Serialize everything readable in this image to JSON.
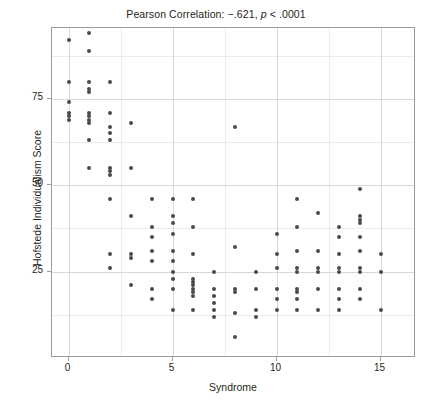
{
  "chart_data": {
    "type": "scatter",
    "title": "Pearson Correlation: −.621, p < .0001",
    "title_prefix": "Pearson Correlation: −.621, ",
    "title_italic": "p",
    "title_suffix": " < .0001",
    "xlabel": "Syndrome",
    "ylabel": "Hofstede Individualism Score",
    "xlim": [
      -0.8,
      16.7
    ],
    "ylim": [
      0,
      95.5
    ],
    "xticks": [
      0,
      5,
      10,
      15
    ],
    "xticklabels": [
      "0",
      "5",
      "10",
      "15"
    ],
    "yticks": [
      25,
      50,
      75
    ],
    "yticklabels": [
      "25",
      "50",
      "75"
    ],
    "grid": true,
    "grid_x_major": [
      0,
      5,
      10,
      15
    ],
    "grid_x_minor": [
      2.5,
      7.5,
      12.5
    ],
    "grid_y_major": [
      25,
      50,
      75
    ],
    "grid_y_minor": [
      12.5,
      37.5,
      62.5,
      87.5
    ],
    "marker_color": "#4a4a4a",
    "marker_size": 4,
    "frame_color": "#9b9b9b",
    "correlation": -0.621,
    "p_value": "< .0001",
    "n_points": 123,
    "points": [
      [
        0,
        92
      ],
      [
        0,
        80
      ],
      [
        0,
        74
      ],
      [
        0,
        71
      ],
      [
        0,
        70
      ],
      [
        0,
        69
      ],
      [
        1,
        94
      ],
      [
        1,
        89
      ],
      [
        1,
        80
      ],
      [
        1,
        78
      ],
      [
        1,
        77
      ],
      [
        1,
        71
      ],
      [
        1,
        70
      ],
      [
        1,
        69
      ],
      [
        1,
        68
      ],
      [
        1,
        63
      ],
      [
        1,
        55
      ],
      [
        2,
        80
      ],
      [
        2,
        71
      ],
      [
        2,
        67
      ],
      [
        2,
        65
      ],
      [
        2,
        63
      ],
      [
        2,
        55
      ],
      [
        2,
        54
      ],
      [
        2,
        53
      ],
      [
        2,
        46
      ],
      [
        2,
        30
      ],
      [
        2,
        26
      ],
      [
        3,
        68
      ],
      [
        3,
        55
      ],
      [
        3,
        41
      ],
      [
        3,
        30
      ],
      [
        3,
        29
      ],
      [
        3,
        21
      ],
      [
        4,
        46
      ],
      [
        4,
        38
      ],
      [
        4,
        35
      ],
      [
        4,
        31
      ],
      [
        4,
        28
      ],
      [
        4,
        20
      ],
      [
        4,
        17
      ],
      [
        5,
        46
      ],
      [
        5,
        41
      ],
      [
        5,
        39
      ],
      [
        5,
        36
      ],
      [
        5,
        31
      ],
      [
        5,
        28
      ],
      [
        5,
        25
      ],
      [
        5,
        23
      ],
      [
        5,
        20
      ],
      [
        5,
        14
      ],
      [
        6,
        46
      ],
      [
        6,
        38
      ],
      [
        6,
        30
      ],
      [
        6,
        23
      ],
      [
        6,
        22
      ],
      [
        6,
        21
      ],
      [
        6,
        20
      ],
      [
        6,
        19
      ],
      [
        6,
        18
      ],
      [
        6,
        14
      ],
      [
        7,
        25
      ],
      [
        7,
        20
      ],
      [
        7,
        18
      ],
      [
        7,
        16
      ],
      [
        7,
        14
      ],
      [
        7,
        12
      ],
      [
        8,
        67
      ],
      [
        8,
        32
      ],
      [
        8,
        20
      ],
      [
        8,
        19
      ],
      [
        8,
        13
      ],
      [
        8,
        6
      ],
      [
        9,
        25
      ],
      [
        9,
        20
      ],
      [
        9,
        14
      ],
      [
        9,
        12
      ],
      [
        10,
        36
      ],
      [
        10,
        30
      ],
      [
        10,
        26
      ],
      [
        10,
        20
      ],
      [
        10,
        17
      ],
      [
        10,
        14
      ],
      [
        11,
        46
      ],
      [
        11,
        38
      ],
      [
        11,
        31
      ],
      [
        11,
        26
      ],
      [
        11,
        25
      ],
      [
        11,
        20
      ],
      [
        11,
        19
      ],
      [
        11,
        17
      ],
      [
        11,
        14
      ],
      [
        12,
        42
      ],
      [
        12,
        31
      ],
      [
        12,
        26
      ],
      [
        12,
        25
      ],
      [
        12,
        20
      ],
      [
        12,
        14
      ],
      [
        13,
        38
      ],
      [
        13,
        35
      ],
      [
        13,
        30
      ],
      [
        13,
        26
      ],
      [
        13,
        25
      ],
      [
        13,
        20
      ],
      [
        13,
        17
      ],
      [
        13,
        14
      ],
      [
        14,
        49
      ],
      [
        14,
        41
      ],
      [
        14,
        40
      ],
      [
        14,
        39
      ],
      [
        14,
        35
      ],
      [
        14,
        31
      ],
      [
        14,
        26
      ],
      [
        14,
        25
      ],
      [
        14,
        20
      ],
      [
        14,
        17
      ],
      [
        15,
        30
      ],
      [
        15,
        25
      ],
      [
        15,
        14
      ]
    ]
  }
}
